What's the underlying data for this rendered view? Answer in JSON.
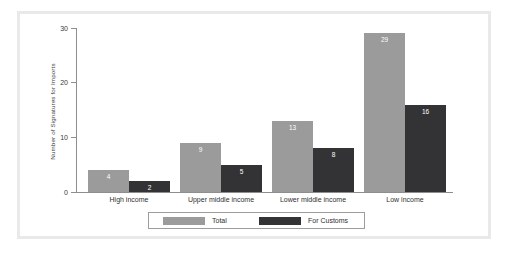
{
  "chart_data": {
    "type": "bar",
    "title": "",
    "xlabel": "",
    "ylabel": "Number of Signatures for Imports",
    "categories": [
      "High income",
      "Upper middle income",
      "Lower middle income",
      "Low income"
    ],
    "series": [
      {
        "name": "Total",
        "color": "#9b9b9b",
        "values": [
          4,
          9,
          13,
          29
        ]
      },
      {
        "name": "For Customs",
        "color": "#333336",
        "values": [
          2,
          5,
          8,
          16
        ]
      }
    ],
    "ylim": [
      0,
      30
    ],
    "yticks": [
      0,
      10,
      20,
      30
    ],
    "ytick_labels": [
      "0",
      "10",
      "20",
      "30"
    ],
    "grid": false,
    "legend_position": "bottom",
    "value_labels_shown": true
  },
  "legend": {
    "entries": [
      {
        "label": "Total",
        "color": "#9b9b9b"
      },
      {
        "label": "For Customs",
        "color": "#333336"
      }
    ]
  },
  "colors": {
    "total": "#9b9b9b",
    "for_customs": "#333336",
    "axis": "#8e8e8e",
    "frame": "#e9e9e9",
    "text": "#2f2f2f",
    "background": "#ffffff"
  }
}
